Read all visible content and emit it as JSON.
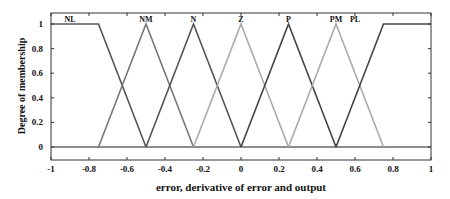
{
  "chart_data": {
    "type": "line",
    "title": "",
    "xlabel": "error, derivative of error and output",
    "ylabel": "Degree of membership",
    "xlim": [
      -1,
      1
    ],
    "ylim": [
      -0.1,
      1.1
    ],
    "xticks": [
      -1,
      -0.8,
      -0.6,
      -0.4,
      -0.2,
      0,
      0.2,
      0.4,
      0.6,
      0.8,
      1
    ],
    "xtick_labels": [
      "-1",
      "-0.8",
      "-0.6",
      "-0.4",
      "-0.2",
      "0",
      "0.2",
      "0.4",
      "0.6",
      "0.8",
      "1"
    ],
    "yticks": [
      0,
      0.2,
      0.4,
      0.6,
      0.8,
      1
    ],
    "ytick_labels": [
      "0",
      "0.2",
      "0.4",
      "0.6",
      "0.8",
      "1"
    ],
    "grid": false,
    "legend": "labels above each membership function",
    "series": [
      {
        "name": "NL",
        "shape": "trapezoid",
        "x": [
          -1,
          -0.75,
          -0.5
        ],
        "y": [
          1,
          1,
          0
        ],
        "color": "#555555"
      },
      {
        "name": "NM",
        "shape": "triangle",
        "x": [
          -0.75,
          -0.5,
          -0.25
        ],
        "y": [
          0,
          1,
          0
        ],
        "color": "#777777"
      },
      {
        "name": "N",
        "shape": "triangle",
        "x": [
          -0.5,
          -0.25,
          0
        ],
        "y": [
          0,
          1,
          0
        ],
        "color": "#555555"
      },
      {
        "name": "Z",
        "shape": "triangle",
        "x": [
          -0.25,
          0,
          0.25
        ],
        "y": [
          0,
          1,
          0
        ],
        "color": "#aaaaaa"
      },
      {
        "name": "P",
        "shape": "triangle",
        "x": [
          0,
          0.25,
          0.5
        ],
        "y": [
          0,
          1,
          0
        ],
        "color": "#444444"
      },
      {
        "name": "PM",
        "shape": "triangle",
        "x": [
          0.25,
          0.5,
          0.75
        ],
        "y": [
          0,
          1,
          0
        ],
        "color": "#aaaaaa"
      },
      {
        "name": "PL",
        "shape": "trapezoid",
        "x": [
          0.5,
          0.75,
          1
        ],
        "y": [
          0,
          1,
          1
        ],
        "color": "#444444"
      }
    ]
  }
}
